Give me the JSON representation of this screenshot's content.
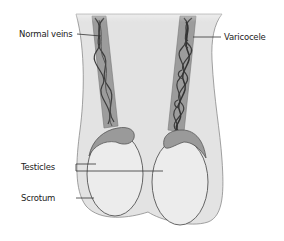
{
  "diagram": {
    "labels": {
      "normal_veins": "Normal veins",
      "varicocele": "Varicocele",
      "testicles": "Testicles",
      "scrotum": "Scrotum"
    },
    "colors": {
      "background": "#ffffff",
      "scrotum_fill": "#e3e3e3",
      "scrotum_stroke": "#8a8a8a",
      "cord_fill": "#9c9c9c",
      "vein_stroke": "#3c3c3c",
      "testicle_fill": "#ececec",
      "testicle_stroke": "#555555",
      "epididymis_fill": "#9a9a9a",
      "leader_line": "#333333",
      "text": "#222222"
    }
  }
}
